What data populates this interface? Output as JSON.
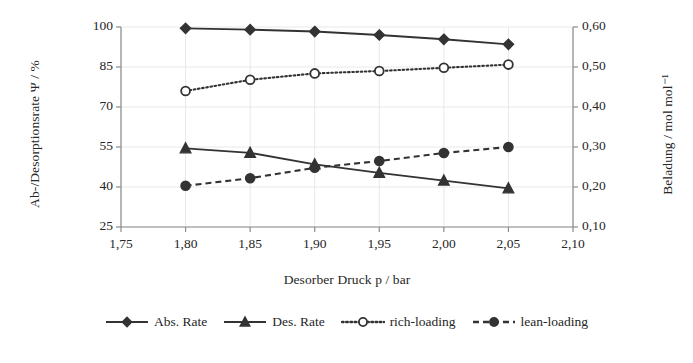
{
  "chart_data": {
    "type": "line",
    "title": "",
    "xlabel": "Desorber Druck p / bar",
    "ylabel": "Ab-/Desorptionsrate Ψ / %",
    "ylabel_secondary": "Beladung / mol mol⁻¹",
    "x": [
      1.8,
      1.85,
      1.9,
      1.95,
      2.0,
      2.05
    ],
    "xlim": [
      1.75,
      2.1
    ],
    "ylim": [
      25,
      100
    ],
    "ylim_secondary": [
      0.1,
      0.6
    ],
    "xticks": [
      "1,75",
      "1,80",
      "1,85",
      "1,90",
      "1,95",
      "2,00",
      "2,05",
      "2,10"
    ],
    "xtick_values": [
      1.75,
      1.8,
      1.85,
      1.9,
      1.95,
      2.0,
      2.05,
      2.1
    ],
    "yticks": [
      "25",
      "40",
      "55",
      "70",
      "85",
      "100"
    ],
    "ytick_values": [
      25,
      40,
      55,
      70,
      85,
      100
    ],
    "yticks_secondary": [
      "0,10",
      "0,20",
      "0,30",
      "0,40",
      "0,50",
      "0,60"
    ],
    "ytick_values_secondary": [
      0.1,
      0.2,
      0.3,
      0.4,
      0.5,
      0.6
    ],
    "grid": true,
    "legend_position": "bottom",
    "series": [
      {
        "name": "Abs. Rate",
        "axis": "left",
        "marker": "diamond",
        "marker_filled": true,
        "linestyle": "solid",
        "color": "#333333",
        "values": [
          99.5,
          99.0,
          98.3,
          97.0,
          95.4,
          93.5
        ]
      },
      {
        "name": "Des. Rate",
        "axis": "left",
        "marker": "triangle",
        "marker_filled": true,
        "linestyle": "solid",
        "color": "#333333",
        "values": [
          54.5,
          52.8,
          48.5,
          45.3,
          42.4,
          39.5
        ]
      },
      {
        "name": "rich-loading",
        "axis": "right",
        "marker": "circle",
        "marker_filled": false,
        "linestyle": "dotted",
        "color": "#333333",
        "values": [
          0.44,
          0.468,
          0.484,
          0.49,
          0.498,
          0.506
        ]
      },
      {
        "name": "lean-loading",
        "axis": "right",
        "marker": "circle",
        "marker_filled": true,
        "linestyle": "dashed",
        "color": "#333333",
        "values": [
          0.203,
          0.222,
          0.248,
          0.265,
          0.285,
          0.3
        ]
      }
    ]
  },
  "legend": {
    "items": [
      {
        "label": "Abs. Rate"
      },
      {
        "label": "Des. Rate"
      },
      {
        "label": "rich-loading"
      },
      {
        "label": "lean-loading"
      }
    ]
  },
  "colors": {
    "foreground": "#333333",
    "axis": "#8c8c8c",
    "grid": "#e8e8e8",
    "background": "#ffffff"
  }
}
